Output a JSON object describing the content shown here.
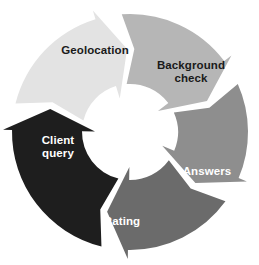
{
  "diagram": {
    "type": "cycle-process-diagram",
    "title": "",
    "direction": "clockwise",
    "center": {
      "x": 130,
      "y": 132
    },
    "outer_radius": 118,
    "inner_radius": 48,
    "background_color": "#ffffff",
    "segments": [
      {
        "id": "geolocation",
        "label": "Geolocation",
        "label_lines": [
          "Geolocation"
        ],
        "order": 1,
        "color": "#e3e3e3",
        "text_color": "#1a1a1a",
        "start_angle_deg": 284,
        "end_angle_deg": 358,
        "label_x": 95,
        "label_y": 51
      },
      {
        "id": "background-check",
        "label": "Background check",
        "label_lines": [
          "Background",
          "check"
        ],
        "order": 2,
        "color": "#b6b6b6",
        "text_color": "#1a1a1a",
        "start_angle_deg": 356,
        "end_angle_deg": 68,
        "label_x": 191,
        "label_y": 72
      },
      {
        "id": "answers",
        "label": "Answers",
        "label_lines": [
          "Answers"
        ],
        "order": 3,
        "color": "#8e8e8e",
        "text_color": "#ffffff",
        "start_angle_deg": 66,
        "end_angle_deg": 128,
        "label_x": 207,
        "label_y": 172
      },
      {
        "id": "rating",
        "label": "Rating",
        "label_lines": [
          "Rating"
        ],
        "order": 4,
        "color": "#6b6b6b",
        "text_color": "#ffffff",
        "start_angle_deg": 126,
        "end_angle_deg": 196,
        "label_x": 122,
        "label_y": 222
      },
      {
        "id": "client-query",
        "label": "Client query",
        "label_lines": [
          "Client",
          "query"
        ],
        "order": 5,
        "color": "#1e1e1e",
        "text_color": "#ffffff",
        "start_angle_deg": 194,
        "end_angle_deg": 286,
        "label_x": 58,
        "label_y": 147
      }
    ]
  }
}
